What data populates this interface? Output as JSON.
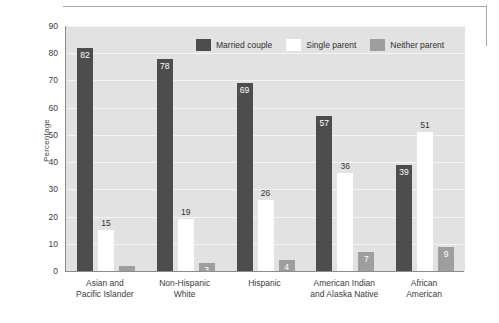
{
  "chart_data": {
    "type": "bar",
    "title": "",
    "xlabel": "",
    "ylabel": "Percentage",
    "ylim": [
      0,
      90
    ],
    "yticks": [
      0,
      10,
      20,
      30,
      40,
      50,
      60,
      70,
      80,
      90
    ],
    "grid": true,
    "legend_position": "top-center",
    "categories": [
      "Asian and\nPacific Islander",
      "Non-Hispanic\nWhite",
      "Hispanic",
      "American Indian\nand Alaska Native",
      "African\nAmerican"
    ],
    "category_lines": [
      [
        "Asian and",
        "Pacific Islander"
      ],
      [
        "Non-Hispanic",
        "White"
      ],
      [
        "Hispanic",
        ""
      ],
      [
        "American Indian",
        "and Alaska Native"
      ],
      [
        "African",
        "American"
      ]
    ],
    "series": [
      {
        "name": "Married couple",
        "color": "#4d4d4d",
        "values": [
          82,
          78,
          69,
          57,
          39
        ],
        "labels": [
          "82",
          "78",
          "69",
          "57",
          "39"
        ]
      },
      {
        "name": "Single parent",
        "color": "#ffffff",
        "values": [
          15,
          19,
          26,
          36,
          51
        ],
        "labels": [
          "15",
          "19",
          "26",
          "36",
          "51"
        ]
      },
      {
        "name": "Neither parent",
        "color": "#9e9e9e",
        "values": [
          2,
          3,
          4,
          7,
          9
        ],
        "labels": [
          "",
          "3",
          "4",
          "7",
          "9"
        ]
      }
    ]
  },
  "axis": {
    "ytick_labels": [
      "90",
      "80",
      "70",
      "60",
      "50",
      "40",
      "30",
      "20",
      "10",
      "0"
    ],
    "ylabel": "Percentage"
  },
  "legend": {
    "items": [
      {
        "label": "Married couple"
      },
      {
        "label": "Single parent"
      },
      {
        "label": "Neither parent"
      }
    ]
  },
  "colors": {
    "married": "#4d4d4d",
    "single": "#ffffff",
    "neither": "#9e9e9e",
    "plot_background": "#e2e2e2",
    "gridline": "#f4f4f4",
    "axis": "#8c8c8c"
  }
}
